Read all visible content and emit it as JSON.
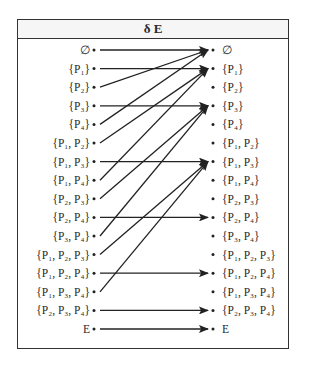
{
  "title": "δ E",
  "rows_left": [
    "∅",
    "{P₁}",
    "{P₂}",
    "{P₃}",
    "{P₄}",
    "{P₁, P₂}",
    "{P₁, P₃}",
    "{P₁, P₄}",
    "{P₂, P₃}",
    "{P₂, P₄}",
    "{P₃, P₄}",
    "{P₁, P₂, P₃}",
    "{P₁, P₂, P₄}",
    "{P₁, P₃, P₄}",
    "{P₂, P₃, P₄}",
    "E"
  ],
  "rows_right": [
    "∅",
    "{P₁}",
    "{P₂}",
    "{P₃}",
    "{P₄}",
    "{P₁, P₂}",
    "{P₁, P₃}",
    "{P₁, P₄}",
    "{P₂, P₃}",
    "{P₂, P₄}",
    "{P₃, P₄}",
    "{P₁, P₂, P₃}",
    "{P₁, P₂, P₄}",
    "{P₁, P₃, P₄}",
    "{P₂, P₃, P₄}",
    "E"
  ],
  "mapping": [
    0,
    1,
    0,
    3,
    0,
    1,
    6,
    1,
    3,
    9,
    3,
    6,
    12,
    6,
    14,
    15
  ]
}
